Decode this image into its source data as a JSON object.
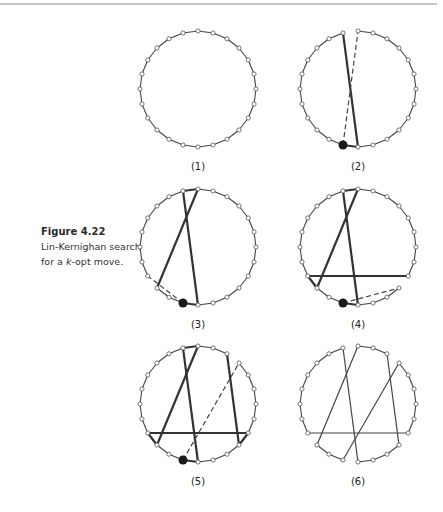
{
  "caption": {
    "figure_number": "Figure 4.22",
    "text_parts": [
      "Lin-Kernighan search",
      "for a ",
      "k",
      "-opt move."
    ]
  },
  "diagram": {
    "node_count": 24,
    "radius": 58,
    "colors": {
      "tour": "#444444",
      "bold": "#333333",
      "node_fill": "#ffffff",
      "node_stroke": "#555555",
      "start_node": "#1a1a1a"
    },
    "panels": [
      {
        "label": "(1)",
        "center": [
          198,
          89
        ],
        "removed_arcs": [],
        "bold_arcs": [],
        "lines": [],
        "dashed": [],
        "start": null
      },
      {
        "label": "(2)",
        "center": [
          358,
          89
        ],
        "removed_arcs": [
          [
            90,
            105
          ]
        ],
        "bold_arcs": [
          [
            255,
            270
          ]
        ],
        "lines": [
          [
            105,
            270
          ]
        ],
        "dashed": [
          [
            255,
            90
          ]
        ],
        "start": 255
      },
      {
        "label": "(3)",
        "center": [
          198,
          247
        ],
        "removed_arcs": [
          [
            210,
            225
          ]
        ],
        "bold_arcs": [
          [
            255,
            270
          ],
          [
            90,
            105
          ]
        ],
        "lines": [
          [
            105,
            270
          ],
          [
            90,
            225
          ]
        ],
        "dashed": [
          [
            255,
            210
          ]
        ],
        "start": 255
      },
      {
        "label": "(4)",
        "center": [
          358,
          247
        ],
        "removed_arcs": [
          [
            315,
            330
          ]
        ],
        "bold_arcs": [
          [
            255,
            270
          ],
          [
            90,
            105
          ],
          [
            210,
            225
          ]
        ],
        "lines": [
          [
            105,
            270
          ],
          [
            90,
            225
          ],
          [
            210,
            330
          ]
        ],
        "dashed": [
          [
            255,
            315
          ]
        ],
        "start": 255
      },
      {
        "label": "(5)",
        "center": [
          198,
          404
        ],
        "removed_arcs": [
          [
            45,
            60
          ]
        ],
        "bold_arcs": [
          [
            255,
            270
          ],
          [
            90,
            105
          ],
          [
            210,
            225
          ],
          [
            315,
            330
          ]
        ],
        "lines": [
          [
            105,
            270
          ],
          [
            90,
            225
          ],
          [
            210,
            330
          ],
          [
            60,
            315
          ]
        ],
        "dashed": [
          [
            255,
            45
          ]
        ],
        "start": 255
      },
      {
        "label": "(6)",
        "center": [
          358,
          404
        ],
        "removed_arcs": [
          [
            90,
            105
          ],
          [
            210,
            225
          ],
          [
            255,
            270
          ],
          [
            315,
            330
          ],
          [
            45,
            60
          ]
        ],
        "bold_arcs": [],
        "thin_lines": [
          [
            105,
            270
          ],
          [
            90,
            225
          ],
          [
            210,
            330
          ],
          [
            60,
            315
          ],
          [
            255,
            45
          ]
        ],
        "lines": [],
        "dashed": [],
        "start": null
      }
    ]
  }
}
